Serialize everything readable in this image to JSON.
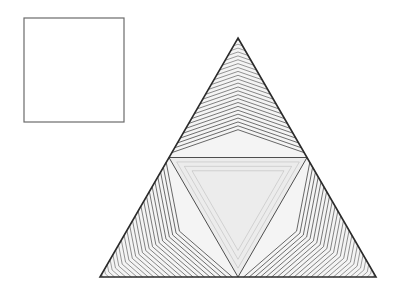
{
  "page": {
    "width": 405,
    "height": 299,
    "background_color": "#ffffff"
  },
  "colors": {
    "background": "#ffffff",
    "stroke": "#3a3a3a",
    "stroke_dark": "#2b2b2b",
    "square_border": "#6b6b6b",
    "fill_light": "#ececec",
    "fill_lighter": "#f4f4f4",
    "fill_mid": "#d8d8d8"
  },
  "square": {
    "label": "empty-square",
    "x": 24,
    "y": 18,
    "width": 100,
    "height": 104,
    "border_width": 1.2,
    "border_color": "#6b6b6b",
    "fill": "#ffffff"
  },
  "triangle": {
    "label": "nested-chevron-triangle",
    "apex": {
      "x": 238,
      "y": 38
    },
    "bottom_left": {
      "x": 100,
      "y": 277
    },
    "bottom_right": {
      "x": 376,
      "y": 277
    },
    "mid_left": {
      "x": 169,
      "y": 157.5
    },
    "mid_right": {
      "x": 307,
      "y": 157.5
    },
    "mid_bottom": {
      "x": 238,
      "y": 277
    },
    "outline_width": 1.6,
    "line_count": 24,
    "line_width": 0.7
  },
  "chart_data": {
    "type": "diagram",
    "elements": [
      {
        "name": "square",
        "shape": "rectangle",
        "filled": false,
        "stroke": "#6b6b6b"
      },
      {
        "name": "main-triangle",
        "shape": "triangle",
        "subdivisions": 4,
        "nested_lines_per_subtriangle": 24
      }
    ]
  }
}
